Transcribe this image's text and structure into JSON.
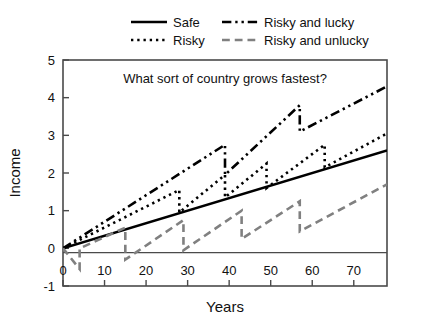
{
  "figure": {
    "background": "#ffffff",
    "frame_color": "#4a4a4a"
  },
  "legend": {
    "position": "above-plot",
    "entries": [
      {
        "label": "Safe",
        "style": "solid",
        "color": "#000000"
      },
      {
        "label": "Risky and lucky",
        "style": "dash-dot-dot",
        "color": "#000000"
      },
      {
        "label": "Risky",
        "style": "dotted",
        "color": "#000000"
      },
      {
        "label": "Risky and unlucky",
        "style": "dashed",
        "color": "#808080"
      }
    ]
  },
  "chart_data": {
    "type": "line",
    "title": "What sort of country grows fastest?",
    "xlabel": "Years",
    "ylabel": "Income",
    "xlim": [
      0,
      78
    ],
    "ylim": [
      -1,
      5
    ],
    "xticks": [
      0,
      10,
      20,
      30,
      40,
      50,
      60,
      70
    ],
    "xtick_labels": [
      "0",
      "10",
      "20",
      "30",
      "40",
      "50",
      "60",
      "70"
    ],
    "yticks": [
      -1,
      0,
      1,
      2,
      3,
      4,
      5
    ],
    "ytick_labels": [
      "-1",
      "0",
      "1",
      "2",
      "3",
      "4",
      "5"
    ],
    "grid": false,
    "series": [
      {
        "name": "Safe",
        "style": "solid",
        "color": "#000000",
        "width": 2.6,
        "points": [
          [
            0,
            0
          ],
          [
            78,
            2.6
          ]
        ]
      },
      {
        "name": "Risky",
        "style": "dotted",
        "color": "#000000",
        "width": 2.6,
        "points": [
          [
            0,
            0
          ],
          [
            28,
            1.55
          ],
          [
            28,
            0.95
          ],
          [
            39,
            1.95
          ],
          [
            39,
            1.35
          ],
          [
            49,
            2.25
          ],
          [
            49,
            1.6
          ],
          [
            63,
            2.75
          ],
          [
            63,
            2.15
          ],
          [
            78,
            3.05
          ]
        ]
      },
      {
        "name": "Risky and lucky",
        "style": "dash-dot-dot",
        "color": "#000000",
        "width": 2.6,
        "points": [
          [
            0,
            0
          ],
          [
            39,
            2.75
          ],
          [
            39,
            1.95
          ],
          [
            57,
            3.8
          ],
          [
            57,
            3.1
          ],
          [
            78,
            4.3
          ]
        ]
      },
      {
        "name": "Risky and unlucky",
        "style": "dashed",
        "color": "#808080",
        "width": 2.6,
        "points": [
          [
            0,
            0
          ],
          [
            4,
            -0.55
          ],
          [
            4,
            0.0
          ],
          [
            15,
            0.55
          ],
          [
            15,
            -0.3
          ],
          [
            29,
            0.75
          ],
          [
            29,
            -0.05
          ],
          [
            43,
            1.0
          ],
          [
            43,
            0.25
          ],
          [
            57,
            1.25
          ],
          [
            57,
            0.45
          ],
          [
            78,
            1.7
          ]
        ]
      }
    ]
  }
}
